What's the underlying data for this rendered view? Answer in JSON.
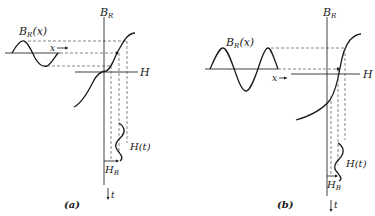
{
  "figure": {
    "panels": [
      {
        "id": "a",
        "caption": "(a)",
        "labels": {
          "input_wave": "B",
          "input_wave_sub": "R",
          "input_wave_arg": "(x)",
          "x_arrow": "x",
          "y_axis": "B",
          "y_axis_sub": "R",
          "h_axis": "H",
          "output_wave": "H(t)",
          "bias": "H",
          "bias_sub": "B",
          "time": "t"
        }
      },
      {
        "id": "b",
        "caption": "(b)",
        "labels": {
          "input_wave": "B",
          "input_wave_sub": "R",
          "input_wave_arg": "(x)",
          "x_arrow": "x",
          "y_axis": "B",
          "y_axis_sub": "R",
          "h_axis": "H",
          "output_wave": "H(t)",
          "bias": "H",
          "bias_sub": "B",
          "time": "t"
        }
      }
    ],
    "colors": {
      "ink": "#1a1a1a",
      "background": "#ffffff"
    }
  }
}
